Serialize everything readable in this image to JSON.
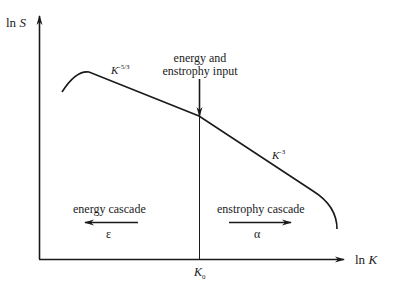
{
  "diagram": {
    "y_axis": {
      "label_prefix": "ln",
      "label_var": "S"
    },
    "x_axis": {
      "label_prefix": "ln",
      "label_var": "K"
    },
    "marker": {
      "var": "K",
      "subscript": "0"
    },
    "input_label": {
      "line1": "energy and",
      "line2": "enstrophy input"
    },
    "slope_left": {
      "var": "K",
      "exponent": "-5/3"
    },
    "slope_right": {
      "var": "K",
      "exponent": "-3"
    },
    "left_cascade": {
      "label": "energy cascade",
      "symbol": "ε",
      "direction": "left"
    },
    "right_cascade": {
      "label": "enstrophy cascade",
      "symbol": "α",
      "direction": "right"
    },
    "colors": {
      "ink": "#1a1a1a",
      "background": "#ffffff"
    }
  }
}
